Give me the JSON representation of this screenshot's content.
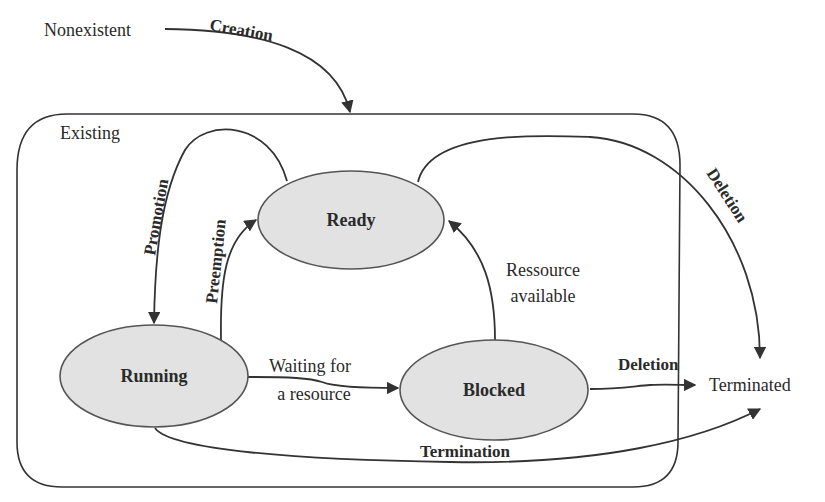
{
  "diagram": {
    "type": "state-transition",
    "outer_states": {
      "nonexistent": "Nonexistent",
      "existing": "Existing",
      "terminated": "Terminated"
    },
    "states": {
      "ready": "Ready",
      "running": "Running",
      "blocked": "Blocked"
    },
    "transitions": {
      "creation": "Creation",
      "promotion": "Promotion",
      "preemption": "Preemption",
      "waiting_line1": "Waiting for",
      "waiting_line2": "a resource",
      "resource_line1": "Ressource",
      "resource_line2": "available",
      "deletion_ready": "Deletion",
      "deletion_blocked": "Deletion",
      "termination": "Termination"
    },
    "edges": [
      {
        "from": "Nonexistent",
        "to": "Existing",
        "label": "Creation"
      },
      {
        "from": "Ready",
        "to": "Running",
        "label": "Promotion"
      },
      {
        "from": "Running",
        "to": "Ready",
        "label": "Preemption"
      },
      {
        "from": "Running",
        "to": "Blocked",
        "label": "Waiting for a resource"
      },
      {
        "from": "Blocked",
        "to": "Ready",
        "label": "Ressource available"
      },
      {
        "from": "Ready",
        "to": "Terminated",
        "label": "Deletion"
      },
      {
        "from": "Blocked",
        "to": "Terminated",
        "label": "Deletion"
      },
      {
        "from": "Running",
        "to": "Terminated",
        "label": "Termination"
      }
    ],
    "colors": {
      "state_fill": "#e2e2e2",
      "stroke": "#333333",
      "text": "#2a2a2a"
    }
  }
}
